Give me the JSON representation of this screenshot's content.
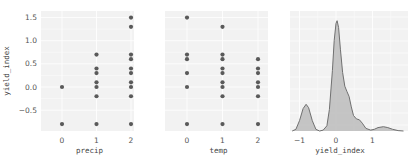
{
  "chart_data": [
    {
      "type": "scatter",
      "panel": "precip-vs-yield",
      "xlabel": "precip",
      "ylabel": "yield_index",
      "x_ticks": [
        0,
        1,
        2
      ],
      "y_ticks": [
        -0.5,
        0.0,
        0.5,
        1.0,
        1.5
      ],
      "y_tick_labels": [
        "−0.5",
        "0.0",
        "0.5",
        "1.0",
        "1.5"
      ],
      "xlim": [
        -0.6,
        2.0
      ],
      "ylim": [
        -0.9,
        1.6
      ],
      "grid": true,
      "points": [
        {
          "x": 0,
          "y": 0.0
        },
        {
          "x": 0,
          "y": -0.8
        },
        {
          "x": 1,
          "y": 0.7
        },
        {
          "x": 1,
          "y": 0.4
        },
        {
          "x": 1,
          "y": 0.3
        },
        {
          "x": 1,
          "y": 0.1
        },
        {
          "x": 1,
          "y": 0.0
        },
        {
          "x": 1,
          "y": -0.2
        },
        {
          "x": 1,
          "y": -0.8
        },
        {
          "x": 2,
          "y": 1.5
        },
        {
          "x": 2,
          "y": 1.3
        },
        {
          "x": 2,
          "y": 0.7
        },
        {
          "x": 2,
          "y": 0.6
        },
        {
          "x": 2,
          "y": 0.4
        },
        {
          "x": 2,
          "y": 0.3
        },
        {
          "x": 2,
          "y": 0.1
        },
        {
          "x": 2,
          "y": 0.0
        },
        {
          "x": 2,
          "y": -0.2
        },
        {
          "x": 2,
          "y": -0.8
        }
      ]
    },
    {
      "type": "scatter",
      "panel": "temp-vs-yield",
      "xlabel": "temp",
      "ylabel": "",
      "x_ticks": [
        0,
        1,
        2
      ],
      "xlim": [
        -0.6,
        2.3
      ],
      "ylim": [
        -0.9,
        1.6
      ],
      "grid": true,
      "points": [
        {
          "x": 0,
          "y": 1.5
        },
        {
          "x": 0,
          "y": 0.7
        },
        {
          "x": 0,
          "y": 0.6
        },
        {
          "x": 0,
          "y": 0.3
        },
        {
          "x": 0,
          "y": 0.0
        },
        {
          "x": 0,
          "y": -0.8
        },
        {
          "x": 1,
          "y": 1.3
        },
        {
          "x": 1,
          "y": 0.7
        },
        {
          "x": 1,
          "y": 0.6
        },
        {
          "x": 1,
          "y": 0.4
        },
        {
          "x": 1,
          "y": 0.3
        },
        {
          "x": 1,
          "y": 0.1
        },
        {
          "x": 1,
          "y": 0.0
        },
        {
          "x": 1,
          "y": -0.2
        },
        {
          "x": 1,
          "y": -0.8
        },
        {
          "x": 2,
          "y": 0.6
        },
        {
          "x": 2,
          "y": 0.4
        },
        {
          "x": 2,
          "y": 0.3
        },
        {
          "x": 2,
          "y": 0.1
        },
        {
          "x": 2,
          "y": 0.0
        },
        {
          "x": 2,
          "y": -0.2
        },
        {
          "x": 2,
          "y": -0.8
        }
      ]
    },
    {
      "type": "area",
      "panel": "yield-index-kde",
      "xlabel": "yield_index",
      "ylabel": "",
      "x_ticks": [
        -1,
        0,
        1
      ],
      "x_tick_labels": [
        "−1",
        "0",
        "1"
      ],
      "xlim": [
        -1.25,
        1.95
      ],
      "grid": true,
      "fill_color": "#bcbcbc",
      "line_color": "#6f6f6f",
      "curve": [
        [
          -1.2,
          0.0
        ],
        [
          -1.1,
          0.02
        ],
        [
          -1.0,
          0.12
        ],
        [
          -0.9,
          0.26
        ],
        [
          -0.82,
          0.31
        ],
        [
          -0.75,
          0.27
        ],
        [
          -0.65,
          0.12
        ],
        [
          -0.55,
          0.02
        ],
        [
          -0.45,
          0.0
        ],
        [
          -0.35,
          0.01
        ],
        [
          -0.25,
          0.06
        ],
        [
          -0.18,
          0.25
        ],
        [
          -0.1,
          0.7
        ],
        [
          -0.05,
          1.05
        ],
        [
          0.0,
          1.25
        ],
        [
          0.03,
          1.28
        ],
        [
          0.07,
          1.2
        ],
        [
          0.12,
          0.95
        ],
        [
          0.18,
          0.68
        ],
        [
          0.24,
          0.52
        ],
        [
          0.3,
          0.46
        ],
        [
          0.36,
          0.4
        ],
        [
          0.42,
          0.28
        ],
        [
          0.48,
          0.18
        ],
        [
          0.56,
          0.14
        ],
        [
          0.64,
          0.13
        ],
        [
          0.72,
          0.09
        ],
        [
          0.82,
          0.03
        ],
        [
          0.95,
          0.01
        ],
        [
          1.05,
          0.02
        ],
        [
          1.15,
          0.04
        ],
        [
          1.3,
          0.05
        ],
        [
          1.42,
          0.04
        ],
        [
          1.55,
          0.02
        ],
        [
          1.7,
          0.005
        ],
        [
          1.85,
          0.0
        ]
      ],
      "ymax": 1.3
    }
  ],
  "colors": {
    "panel_bg": "#f2f2f2",
    "grid": "#ffffff",
    "marker": "#5a5a5a",
    "kde_fill": "#bcbcbc",
    "kde_line": "#707070"
  }
}
